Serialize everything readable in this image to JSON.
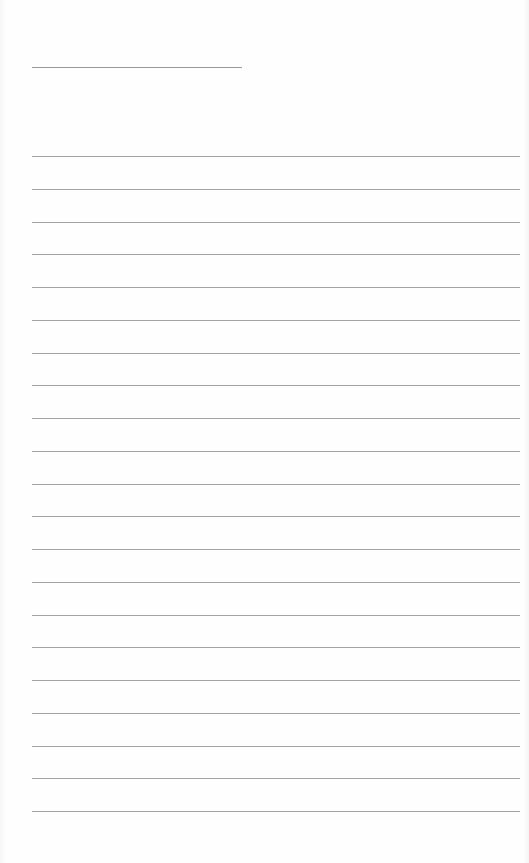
{
  "page": {
    "type": "ruled-paper",
    "background": "#fefefe",
    "line_color": "#a3a3a3",
    "title_line": {
      "top": 67,
      "left": 32,
      "width": 210
    },
    "rules": {
      "count": 21,
      "first_top": 156,
      "spacing": 32.75,
      "left": 32,
      "width": 488
    }
  }
}
